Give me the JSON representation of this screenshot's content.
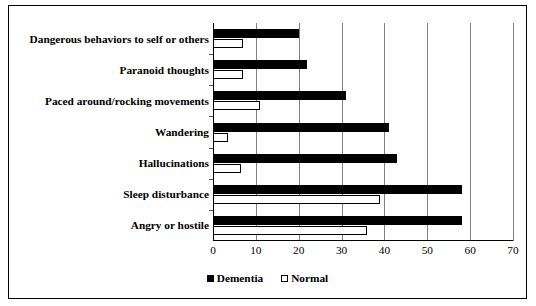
{
  "chart_data": {
    "type": "bar",
    "orientation": "horizontal",
    "title": "",
    "xlabel": "",
    "ylabel": "",
    "xlim": [
      0,
      70
    ],
    "xticks": [
      0,
      10,
      20,
      30,
      40,
      50,
      60,
      70
    ],
    "grid": true,
    "legend_position": "bottom",
    "categories": [
      "Dangerous behaviors to self or others",
      "Paranoid thoughts",
      "Paced around/rocking movements",
      "Wandering",
      "Hallucinations",
      "Sleep disturbance",
      "Angry or hostile"
    ],
    "series": [
      {
        "name": "Dementia",
        "color": "#000000",
        "style": "filled",
        "values": [
          20,
          22,
          31,
          41,
          43,
          58,
          58
        ]
      },
      {
        "name": "Normal",
        "color": "#ffffff",
        "style": "hollow",
        "values": [
          7,
          7,
          11,
          3.5,
          6.5,
          39,
          36
        ]
      }
    ]
  },
  "legend": {
    "entries": [
      {
        "label": "Dementia",
        "swatch": "filled-square-icon"
      },
      {
        "label": "Normal",
        "swatch": "hollow-square-icon"
      }
    ]
  }
}
